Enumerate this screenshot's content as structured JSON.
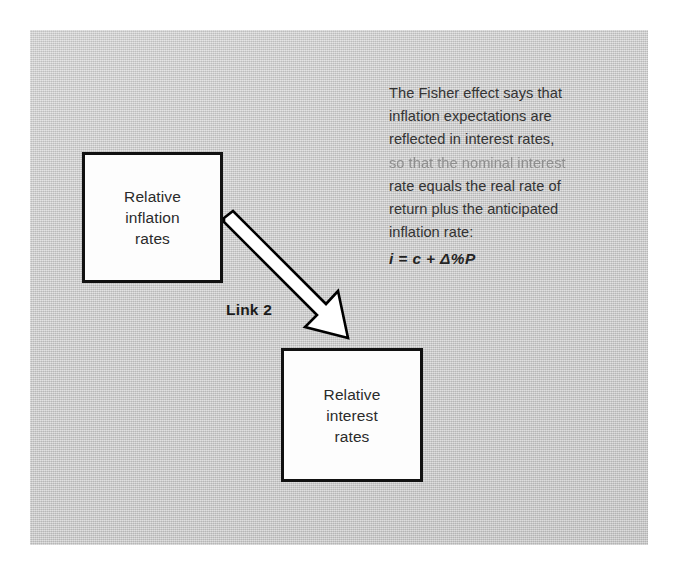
{
  "figure": {
    "canvas_color": "#c9c9c9",
    "box_fill": "#fdfdfd",
    "box_border_color": "#111111",
    "arrow_fill": "#ffffff",
    "arrow_outline": "#000000"
  },
  "nodes": [
    {
      "id": "relative-inflation-rates",
      "lines": [
        "Relative",
        "inflation",
        "rates"
      ]
    },
    {
      "id": "relative-interest-rates",
      "lines": [
        "Relative",
        "interest",
        "rates"
      ]
    }
  ],
  "connector": {
    "label": "Link 2",
    "from": "relative-inflation-rates",
    "to": "relative-interest-rates",
    "style": "block-arrow"
  },
  "description": {
    "lines": [
      "The Fisher effect says that",
      "inflation expectations are",
      "reflected in interest rates,",
      "so that the nominal interest",
      "rate equals the real rate of",
      "return plus the anticipated",
      "inflation rate:"
    ],
    "formula": "i = c + Δ%P"
  }
}
